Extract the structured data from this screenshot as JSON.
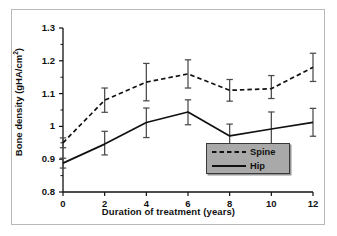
{
  "figure": {
    "border_color": "#b9b9b9",
    "background": "#ffffff"
  },
  "legend": {
    "background": "#a9a9a9",
    "border": "#3a3a3a",
    "items": [
      {
        "label": "Spine",
        "style": "dashed"
      },
      {
        "label": "Hip",
        "style": "solid"
      }
    ]
  },
  "chart_data": {
    "type": "line",
    "title": "",
    "xlabel": "Duration of treatment (years)",
    "ylabel": "Bone density (gHA/cm",
    "ylabel_sup": "2",
    "ylabel_tail": ")",
    "x": [
      0,
      2,
      4,
      6,
      8,
      10,
      12
    ],
    "xlim": [
      0,
      12
    ],
    "ylim": [
      0.8,
      1.3
    ],
    "xticks": [
      "0",
      "2",
      "4",
      "6",
      "8",
      "10",
      "12"
    ],
    "yticks": [
      "0.8",
      "0.9",
      "1",
      "1.1",
      "1.2",
      "1.3"
    ],
    "ytick_values": [
      0.8,
      0.9,
      1.0,
      1.1,
      1.2,
      1.3
    ],
    "minor_yticks": [
      0.85,
      0.95,
      1.05,
      1.15,
      1.25
    ],
    "grid": false,
    "legend_position": "bottom-right",
    "series": [
      {
        "name": "Spine",
        "style": "dashed",
        "color": "#111111",
        "values": [
          0.95,
          1.08,
          1.135,
          1.16,
          1.11,
          1.115,
          1.18
        ],
        "err_low": [
          0.935,
          1.043,
          1.078,
          1.117,
          1.077,
          1.085,
          1.137
        ],
        "err_high": [
          0.965,
          1.117,
          1.192,
          1.203,
          1.143,
          1.155,
          1.223
        ]
      },
      {
        "name": "Hip",
        "style": "solid",
        "color": "#111111",
        "values": [
          0.888,
          0.946,
          1.012,
          1.044,
          0.971,
          0.992,
          1.012
        ],
        "err_low": [
          0.873,
          0.913,
          0.966,
          1.005,
          0.936,
          0.94,
          0.97
        ],
        "err_high": [
          0.903,
          0.985,
          1.056,
          1.081,
          1.007,
          1.044,
          1.055
        ]
      }
    ]
  }
}
